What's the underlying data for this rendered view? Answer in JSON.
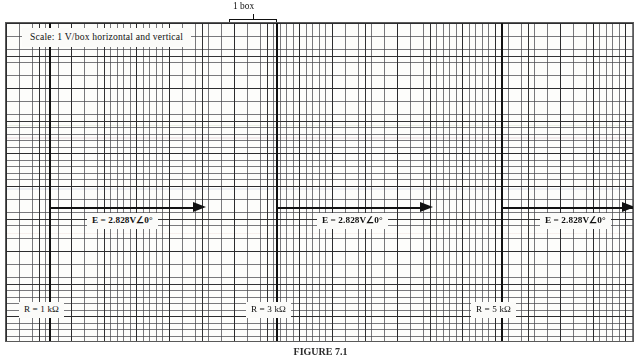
{
  "figure": {
    "type": "oscilloscope-graph-paper-worksheet",
    "caption": "FIGURE 7.1"
  },
  "annotations": {
    "top_brace_label": "1 box",
    "side_brace_label": "1 box (cm)"
  },
  "sheet": {
    "scale_note": "Scale: 1 V/box horizontal and vertical",
    "grid": {
      "fine_cell_px": 6.52,
      "major_every": 5,
      "fine_line_color": "#46464b",
      "major_line_color": "#28282a",
      "paper_color": "#fdfdfb"
    },
    "axes_color": "#111111"
  },
  "plots": [
    {
      "name": "plot-1",
      "source_label": "E = 2.828V∠0°",
      "resistor_label": "R = 1 kΩ",
      "axis_x_px": 48,
      "axis_y_px": 207
    },
    {
      "name": "plot-2",
      "source_label": "E = 2.828V∠0°",
      "resistor_label": "R = 3 kΩ",
      "axis_x_px": 275,
      "axis_y_px": 207
    },
    {
      "name": "plot-3",
      "source_label": "E = 2.828V∠0°",
      "resistor_label": "R = 5 kΩ",
      "axis_x_px": 500,
      "axis_y_px": 207
    }
  ]
}
